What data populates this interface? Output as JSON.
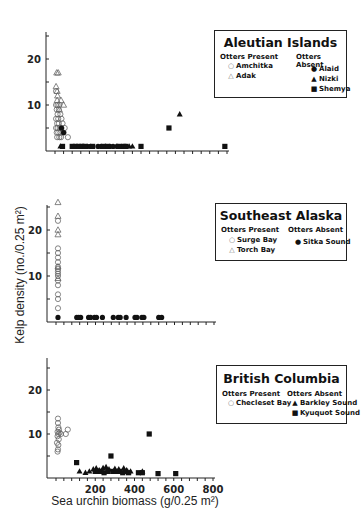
{
  "chart_data": [
    {
      "type": "scatter",
      "title": "Aleutian Islands",
      "xlabel": "",
      "ylabel": "",
      "xlim": [
        0,
        800
      ],
      "ylim": [
        0,
        25
      ],
      "yticks": [
        20,
        10
      ],
      "legend": {
        "present_heading": "Otters Present",
        "absent_heading": "Otters Absent",
        "present": [
          {
            "name": "Amchitka",
            "symbol": "open-circle"
          },
          {
            "name": "Adak",
            "symbol": "open-triangle"
          }
        ],
        "absent": [
          {
            "name": "Alaid",
            "symbol": "filled-circle"
          },
          {
            "name": "Nizki",
            "symbol": "filled-triangle"
          },
          {
            "name": "Shemya",
            "symbol": "filled-square"
          }
        ]
      },
      "series": [
        {
          "name": "Amchitka",
          "symbol": "open-circle",
          "points": [
            [
              5,
              10
            ],
            [
              8,
              9
            ],
            [
              12,
              8
            ],
            [
              15,
              7
            ],
            [
              5,
              7
            ],
            [
              10,
              6
            ],
            [
              18,
              6
            ],
            [
              22,
              5
            ],
            [
              5,
              5
            ],
            [
              12,
              5
            ],
            [
              25,
              4
            ],
            [
              8,
              4
            ],
            [
              15,
              4
            ],
            [
              30,
              5
            ],
            [
              35,
              6
            ],
            [
              20,
              3
            ],
            [
              10,
              3
            ],
            [
              28,
              3
            ],
            [
              40,
              4
            ],
            [
              5,
              13
            ],
            [
              45,
              5
            ],
            [
              60,
              3
            ],
            [
              18,
              9
            ],
            [
              25,
              8
            ],
            [
              30,
              7
            ],
            [
              12,
              10
            ],
            [
              20,
              10
            ]
          ]
        },
        {
          "name": "Adak",
          "symbol": "open-triangle",
          "points": [
            [
              8,
              17
            ],
            [
              15,
              17
            ],
            [
              5,
              14
            ],
            [
              10,
              13
            ],
            [
              12,
              12
            ],
            [
              28,
              11
            ],
            [
              40,
              10
            ],
            [
              20,
              9
            ],
            [
              10,
              11
            ]
          ]
        },
        {
          "name": "Alaid",
          "symbol": "filled-circle",
          "points": [
            [
              40,
              4
            ],
            [
              30,
              5
            ],
            [
              130,
              1
            ],
            [
              150,
              1
            ],
            [
              165,
              1
            ],
            [
              200,
              1
            ],
            [
              215,
              1
            ],
            [
              235,
              1
            ],
            [
              255,
              1
            ],
            [
              270,
              1
            ],
            [
              290,
              1
            ]
          ]
        },
        {
          "name": "Nizki",
          "symbol": "filled-triangle",
          "points": [
            [
              25,
              1
            ],
            [
              285,
              1
            ],
            [
              345,
              1
            ],
            [
              360,
              1
            ],
            [
              580,
              8
            ]
          ]
        },
        {
          "name": "Shemya",
          "symbol": "filled-square",
          "points": [
            [
              35,
              1
            ],
            [
              80,
              1
            ],
            [
              95,
              1
            ],
            [
              110,
              1
            ],
            [
              125,
              1
            ],
            [
              140,
              1
            ],
            [
              175,
              1
            ],
            [
              225,
              1
            ],
            [
              245,
              1
            ],
            [
              300,
              1
            ],
            [
              320,
              1
            ],
            [
              330,
              1
            ],
            [
              400,
              1
            ],
            [
              530,
              5
            ],
            [
              790,
              1
            ]
          ]
        }
      ]
    },
    {
      "type": "scatter",
      "title": "Southeast Alaska",
      "xlabel": "",
      "ylabel": "Kelp density (no./0.25 m²)",
      "xlim": [
        0,
        800
      ],
      "ylim": [
        0,
        25
      ],
      "yticks": [
        20,
        10
      ],
      "legend": {
        "present_heading": "Otters Present",
        "absent_heading": "Otters Absent",
        "present": [
          {
            "name": "Surge Bay",
            "symbol": "open-circle"
          },
          {
            "name": "Torch Bay",
            "symbol": "open-triangle"
          }
        ],
        "absent": [
          {
            "name": "Sitka Sound",
            "symbol": "filled-circle"
          }
        ]
      },
      "series": [
        {
          "name": "Surge Bay",
          "symbol": "open-circle",
          "points": [
            [
              10,
              16
            ],
            [
              10,
              15
            ],
            [
              10,
              14
            ],
            [
              10,
              13
            ],
            [
              10,
              12
            ],
            [
              10,
              11.5
            ],
            [
              10,
              11
            ],
            [
              10,
              10.5
            ],
            [
              10,
              10
            ],
            [
              10,
              9
            ],
            [
              10,
              8
            ],
            [
              10,
              6
            ],
            [
              10,
              5
            ],
            [
              10,
              3
            ],
            [
              10,
              22
            ]
          ]
        },
        {
          "name": "Torch Bay",
          "symbol": "open-triangle",
          "points": [
            [
              10,
              26
            ],
            [
              10,
              23
            ],
            [
              10,
              20
            ],
            [
              10,
              19
            ],
            [
              10,
              12
            ],
            [
              10,
              9.5
            ]
          ]
        },
        {
          "name": "Sitka Sound",
          "symbol": "filled-circle",
          "points": [
            [
              10,
              1
            ],
            [
              105,
              1
            ],
            [
              115,
              1
            ],
            [
              125,
              1
            ],
            [
              165,
              1
            ],
            [
              175,
              1
            ],
            [
              195,
              1
            ],
            [
              205,
              1
            ],
            [
              235,
              1
            ],
            [
              290,
              1
            ],
            [
              315,
              1
            ],
            [
              325,
              1
            ],
            [
              355,
              1
            ],
            [
              400,
              1
            ],
            [
              410,
              1
            ],
            [
              435,
              1
            ],
            [
              445,
              1
            ],
            [
              520,
              1
            ],
            [
              535,
              1
            ]
          ]
        }
      ]
    },
    {
      "type": "scatter",
      "title": "British Columbia",
      "xlabel": "Sea urchin biomass (g/0.25 m²)",
      "ylabel": "",
      "xlim": [
        0,
        800
      ],
      "ylim": [
        0,
        25
      ],
      "yticks": [
        20,
        10
      ],
      "xticks": [
        200,
        400,
        600,
        800
      ],
      "legend": {
        "present_heading": "Otters Present",
        "absent_heading": "Otters Absent",
        "present": [
          {
            "name": "Checleset Bay",
            "symbol": "open-circle"
          }
        ],
        "absent": [
          {
            "name": "Barkley Sound",
            "symbol": "filled-triangle"
          },
          {
            "name": "Kyuquot Sound",
            "symbol": "filled-square"
          }
        ]
      },
      "series": [
        {
          "name": "Checleset Bay",
          "symbol": "open-circle",
          "points": [
            [
              10,
              13.5
            ],
            [
              10,
              12.5
            ],
            [
              12,
              11.5
            ],
            [
              15,
              11
            ],
            [
              8,
              10.5
            ],
            [
              18,
              10.3
            ],
            [
              12,
              10
            ],
            [
              25,
              10
            ],
            [
              8,
              9.5
            ],
            [
              14,
              8.8
            ],
            [
              5,
              8
            ],
            [
              12,
              7.5
            ],
            [
              60,
              11
            ],
            [
              50,
              10
            ],
            [
              10,
              6.5
            ],
            [
              8,
              6
            ]
          ]
        },
        {
          "name": "Barkley Sound",
          "symbol": "filled-triangle",
          "points": [
            [
              120,
              1.5
            ],
            [
              150,
              1.2
            ],
            [
              170,
              1.5
            ],
            [
              190,
              2
            ],
            [
              205,
              2.2
            ],
            [
              220,
              1.8
            ],
            [
              240,
              2.3
            ],
            [
              255,
              2.5
            ],
            [
              270,
              2
            ],
            [
              300,
              2.1
            ],
            [
              320,
              2
            ],
            [
              345,
              2.2
            ],
            [
              360,
              1.8
            ],
            [
              380,
              1.5
            ],
            [
              440,
              1.5
            ]
          ]
        },
        {
          "name": "Kyuquot Sound",
          "symbol": "filled-square",
          "points": [
            [
              105,
              3.5
            ],
            [
              200,
              1.5
            ],
            [
              215,
              1.5
            ],
            [
              230,
              1.5
            ],
            [
              245,
              1.2
            ],
            [
              265,
              1.5
            ],
            [
              280,
              5
            ],
            [
              290,
              1.5
            ],
            [
              305,
              1.5
            ],
            [
              325,
              1.5
            ],
            [
              340,
              1.2
            ],
            [
              355,
              1.5
            ],
            [
              370,
              1.2
            ],
            [
              420,
              1.2
            ],
            [
              440,
              1.2
            ],
            [
              475,
              10
            ],
            [
              520,
              1
            ],
            [
              610,
              1
            ]
          ]
        }
      ]
    }
  ],
  "shared": {
    "y_axis_title": "Kelp density (no./0.25 m²)",
    "x_axis_title": "Sea urchin biomass (g/0.25 m²)"
  }
}
